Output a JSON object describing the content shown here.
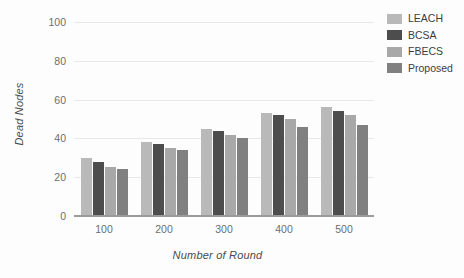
{
  "chart_data": {
    "type": "bar",
    "title": "",
    "xlabel": "Number of Round",
    "ylabel": "Dead Nodes",
    "categories": [
      "100",
      "200",
      "300",
      "400",
      "500"
    ],
    "series": [
      {
        "name": "LEACH",
        "color": "#b9b9b9",
        "values": [
          30,
          38,
          45,
          53,
          56
        ]
      },
      {
        "name": "BCSA",
        "color": "#4d4d4d",
        "values": [
          28,
          37,
          44,
          52,
          54
        ]
      },
      {
        "name": "FBECS",
        "color": "#a8a8a8",
        "values": [
          25.5,
          35,
          42,
          50,
          52
        ]
      },
      {
        "name": "Proposed",
        "color": "#808080",
        "values": [
          24,
          34,
          40,
          46,
          47
        ]
      }
    ],
    "ylim": [
      0,
      100
    ],
    "yticks": [
      "0",
      "20",
      "40",
      "60",
      "80",
      "100"
    ],
    "ytick_values": [
      0,
      20,
      40,
      60,
      80,
      100
    ],
    "grid": true,
    "legend_position": "right"
  },
  "legend": {
    "items": [
      {
        "label": "LEACH"
      },
      {
        "label": "BCSA"
      },
      {
        "label": "FBECS"
      },
      {
        "label": "Proposed"
      }
    ]
  }
}
